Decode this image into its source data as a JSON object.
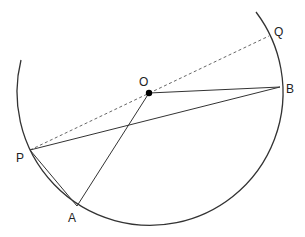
{
  "diagram": {
    "type": "circle-geometry",
    "circle": {
      "center": [
        149,
        93
      ],
      "radius": 133
    },
    "arc": {
      "start": [
        21,
        60
      ],
      "end": [
        256,
        12
      ]
    },
    "points": {
      "O": {
        "label": "O",
        "x": 149,
        "y": 93,
        "label_x": 139,
        "label_y": 86
      },
      "B": {
        "label": "B",
        "x": 280,
        "y": 87,
        "label_x": 286,
        "label_y": 93
      },
      "Q": {
        "label": "Q",
        "x": 269,
        "y": 36,
        "label_x": 274,
        "label_y": 36
      },
      "P": {
        "label": "P",
        "x": 30,
        "y": 150,
        "label_x": 16,
        "label_y": 162
      },
      "A": {
        "label": "A",
        "x": 77,
        "y": 206,
        "label_x": 68,
        "label_y": 222
      }
    },
    "segments": [
      {
        "from": "O",
        "to": "B",
        "style": "solid"
      },
      {
        "from": "P",
        "to": "B",
        "style": "solid"
      },
      {
        "from": "O",
        "to": "A",
        "style": "solid"
      },
      {
        "from": "P",
        "to": "A",
        "style": "solid"
      },
      {
        "from": "P",
        "to": "Q",
        "style": "dashed"
      }
    ],
    "colors": {
      "stroke": "#333333",
      "dot": "#000000"
    }
  }
}
